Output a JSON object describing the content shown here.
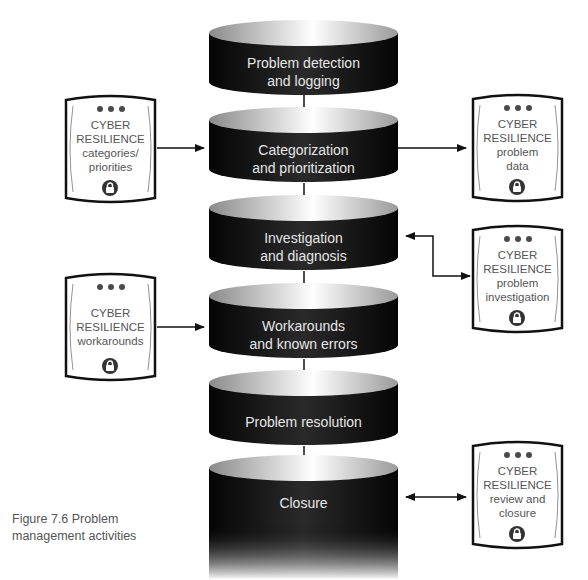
{
  "diagram": {
    "title": "Problem management activities",
    "steps": [
      {
        "id": "detection",
        "lines": [
          "Problem detection",
          "and logging"
        ]
      },
      {
        "id": "categorization",
        "lines": [
          "Categorization",
          "and prioritization"
        ]
      },
      {
        "id": "investigation",
        "lines": [
          "Investigation",
          "and diagnosis"
        ]
      },
      {
        "id": "workarounds",
        "lines": [
          "Workarounds",
          "and known errors"
        ]
      },
      {
        "id": "resolution",
        "lines": [
          "Problem resolution"
        ]
      },
      {
        "id": "closure",
        "lines": [
          "Closure"
        ]
      }
    ],
    "cards": [
      {
        "id": "categories-priorities",
        "side": "left",
        "lines": [
          "CYBER",
          "RESILIENCE",
          "categories/",
          "priorities"
        ],
        "icon": "lock-icon",
        "connects_to": "categorization",
        "arrow": "to-step"
      },
      {
        "id": "problem-data",
        "side": "right",
        "lines": [
          "CYBER",
          "RESILIENCE",
          "problem",
          "data"
        ],
        "icon": "lock-icon",
        "connects_to": "categorization",
        "arrow": "to-card"
      },
      {
        "id": "problem-investigation",
        "side": "right",
        "lines": [
          "CYBER",
          "RESILIENCE",
          "problem",
          "investigation"
        ],
        "icon": "lock-icon",
        "connects_to": "investigation",
        "arrow": "bidirectional"
      },
      {
        "id": "workarounds",
        "side": "left",
        "lines": [
          "CYBER",
          "RESILIENCE",
          "workarounds"
        ],
        "icon": "lock-icon",
        "connects_to": "workarounds",
        "arrow": "to-step"
      },
      {
        "id": "review-closure",
        "side": "right",
        "lines": [
          "CYBER",
          "RESILIENCE",
          "review and",
          "closure"
        ],
        "icon": "lock-icon",
        "connects_to": "closure",
        "arrow": "bidirectional"
      }
    ],
    "caption": {
      "line1": "Figure 7.6  Problem",
      "line2": "management activities"
    }
  }
}
